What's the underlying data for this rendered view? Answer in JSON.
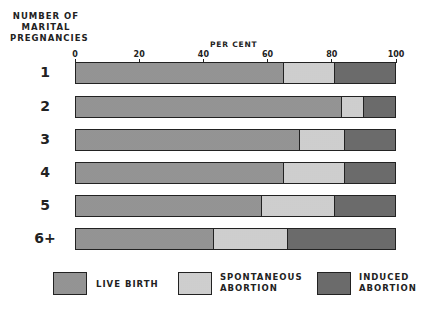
{
  "chart_data": {
    "type": "bar",
    "orientation": "horizontal",
    "stacked": true,
    "title": "",
    "xlabel": "PER CENT",
    "ylabel": "NUMBER OF MARITAL PREGNANCIES",
    "xlim": [
      0,
      100
    ],
    "xticks": [
      "0",
      "20",
      "40",
      "60",
      "80",
      "100"
    ],
    "categories": [
      "1",
      "2",
      "3",
      "4",
      "5",
      "6+"
    ],
    "series": [
      {
        "name": "LIVE BIRTH",
        "values": [
          65,
          83,
          70,
          65,
          58,
          43
        ]
      },
      {
        "name": "SPONTANEOUS ABORTION",
        "values": [
          16,
          7,
          14,
          19,
          23,
          23
        ]
      },
      {
        "name": "INDUCED ABORTION",
        "values": [
          19,
          10,
          16,
          16,
          19,
          34
        ]
      }
    ],
    "legend_position": "bottom",
    "grid": false
  },
  "labels": {
    "ytitle_lines": [
      "NUMBER OF",
      "MARITAL",
      "PREGNANCIES"
    ],
    "xtitle": "PER CENT",
    "ticks": [
      "0",
      "20",
      "40",
      "60",
      "80",
      "100"
    ],
    "rows": [
      "1",
      "2",
      "3",
      "4",
      "5",
      "6+"
    ]
  },
  "legend": {
    "live": "LIVE BIRTH",
    "spont_1": "SPONTANEOUS",
    "spont_2": "ABORTION",
    "induced_1": "INDUCED",
    "induced_2": "ABORTION"
  }
}
